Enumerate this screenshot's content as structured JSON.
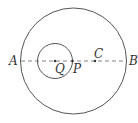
{
  "diagram": {
    "type": "geometry",
    "colors": {
      "stroke": "#555555",
      "text": "#333333",
      "background": "#ffffff"
    },
    "big_circle": {
      "center_label": "C",
      "cx": 73.5,
      "cy": 61,
      "r": 53
    },
    "small_circle": {
      "center_label": "Q",
      "cx": 55,
      "cy": 61,
      "r": 17
    },
    "line": {
      "style": "dashed",
      "from_label": "A",
      "to_label": "B"
    },
    "points": [
      {
        "label": "A",
        "x": 21,
        "y": 61
      },
      {
        "label": "Q",
        "x": 55,
        "y": 61
      },
      {
        "label": "P",
        "x": 72,
        "y": 61
      },
      {
        "label": "C",
        "x": 95,
        "y": 61
      },
      {
        "label": "B",
        "x": 126,
        "y": 61
      }
    ],
    "labels": {
      "A": "A",
      "B": "B",
      "C": "C",
      "P": "P",
      "Q": "Q"
    }
  }
}
